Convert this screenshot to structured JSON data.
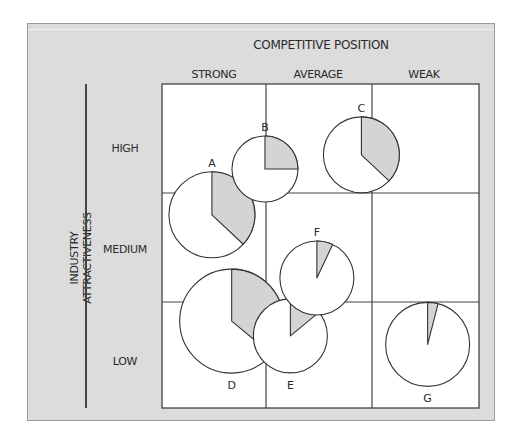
{
  "chart_data": {
    "type": "bubble-pie-matrix",
    "title": "",
    "x_axis": {
      "title": "COMPETITIVE POSITION",
      "categories": [
        "STRONG",
        "AVERAGE",
        "WEAK"
      ]
    },
    "y_axis": {
      "title": [
        "INDUSTRY",
        "ATTRACTIVENESS"
      ],
      "categories": [
        "HIGH",
        "MEDIUM",
        "LOW"
      ]
    },
    "colors": {
      "panel": "#dcdcdc",
      "grid": "#444444",
      "shaded": "#d4d4d4",
      "pie_fill": "#ffffff"
    },
    "businesses": [
      {
        "label": "A",
        "x": 0.48,
        "y": 1.2,
        "relative_size": 43,
        "shaded_share": 0.37
      },
      {
        "label": "B",
        "x": 0.99,
        "y": 0.78,
        "relative_size": 33,
        "shaded_share": 0.25
      },
      {
        "label": "C",
        "x": 1.9,
        "y": 0.65,
        "relative_size": 38,
        "shaded_share": 0.37
      },
      {
        "label": "D",
        "x": 0.67,
        "y": 2.18,
        "relative_size": 52,
        "shaded_share": 0.36
      },
      {
        "label": "E",
        "x": 1.23,
        "y": 2.32,
        "relative_size": 37,
        "shaded_share": 0.14
      },
      {
        "label": "F",
        "x": 1.48,
        "y": 1.78,
        "relative_size": 37,
        "shaded_share": 0.07
      },
      {
        "label": "G",
        "x": 2.52,
        "y": 2.4,
        "relative_size": 42,
        "shaded_share": 0.04
      }
    ]
  }
}
